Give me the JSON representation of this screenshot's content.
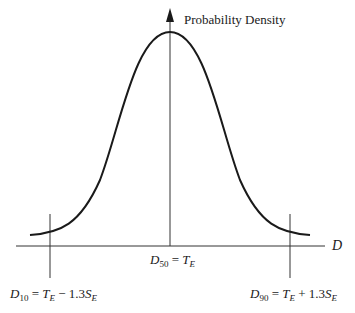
{
  "diagram": {
    "y_axis_label": "Probability Density",
    "x_axis_label": "D",
    "center_label": {
      "var": "D",
      "sub": "50",
      "eq": " = ",
      "rhs_var": "T",
      "rhs_sub": "E"
    },
    "left_label": {
      "var": "D",
      "sub": "10",
      "eq": " = ",
      "t": "T",
      "t_sub": "E",
      "op": " − 1.3",
      "s": "S",
      "s_sub": "E"
    },
    "right_label": {
      "var": "D",
      "sub": "90",
      "eq": " = ",
      "t": "T",
      "t_sub": "E",
      "op": " + 1.3",
      "s": "S",
      "s_sub": "E"
    },
    "colors": {
      "line": "#1a1a1a",
      "axis": "#333333"
    }
  }
}
